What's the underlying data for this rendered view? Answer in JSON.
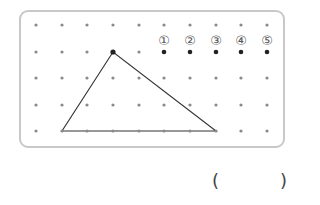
{
  "grid": {
    "columns": 10,
    "rows": 5,
    "x": [
      36,
      62,
      87,
      113,
      139,
      164,
      190,
      216,
      241,
      267
    ],
    "y": [
      25,
      52,
      78,
      105,
      131
    ],
    "dot_color": "#8a8a8a"
  },
  "triangle": {
    "vertices": [
      [
        3,
        1
      ],
      [
        1,
        4
      ],
      [
        7,
        4
      ]
    ],
    "stroke": "#333333"
  },
  "options": [
    {
      "label": "①",
      "col": 5,
      "row": 1
    },
    {
      "label": "②",
      "col": 6,
      "row": 1
    },
    {
      "label": "③",
      "col": 7,
      "row": 1
    },
    {
      "label": "④",
      "col": 8,
      "row": 1
    },
    {
      "label": "⑤",
      "col": 9,
      "row": 1
    }
  ],
  "answer": {
    "open": "(",
    "close": ")",
    "value": ""
  }
}
